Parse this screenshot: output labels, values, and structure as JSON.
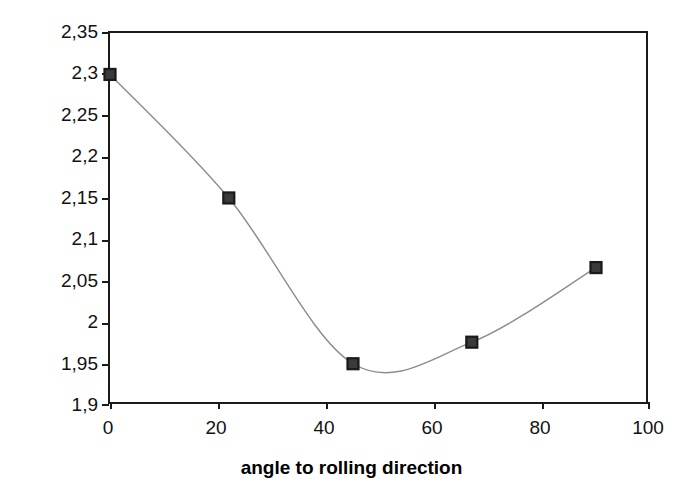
{
  "chart_data": {
    "type": "line",
    "title": "",
    "subtitle": "",
    "xlabel": "angle to rolling direction",
    "ylabel": "Modulus of resilience (MPa)",
    "xlim": [
      0,
      100
    ],
    "ylim": [
      1.9,
      2.35
    ],
    "grid": false,
    "legend": null,
    "decimal_separator": ",",
    "x_tick_labels": [
      "0",
      "20",
      "40",
      "60",
      "80",
      "100"
    ],
    "x_tick_values": [
      0,
      20,
      40,
      60,
      80,
      100
    ],
    "y_tick_labels": [
      "2,35",
      "2,3",
      "2,25",
      "2,2",
      "2,15",
      "2,1",
      "2,05",
      "2",
      "1,95",
      "1,9"
    ],
    "y_tick_values": [
      2.35,
      2.3,
      2.25,
      2.2,
      2.15,
      2.1,
      2.05,
      2.0,
      1.95,
      1.9
    ],
    "series": [
      {
        "name": "Modulus of resilience",
        "line_style": "smooth",
        "line_color": "#8c8c8c",
        "marker": "square",
        "marker_color": "#1a1a1a",
        "x": [
          0,
          22,
          45,
          67,
          90
        ],
        "y": [
          2.3,
          2.151,
          1.951,
          1.977,
          2.067
        ]
      }
    ],
    "annotations": []
  },
  "axes": {
    "y_title": "Modulus of resilience (MPa)",
    "x_title": "angle to rolling direction",
    "frame_color": "#1a1a1a",
    "background": "#ffffff"
  }
}
